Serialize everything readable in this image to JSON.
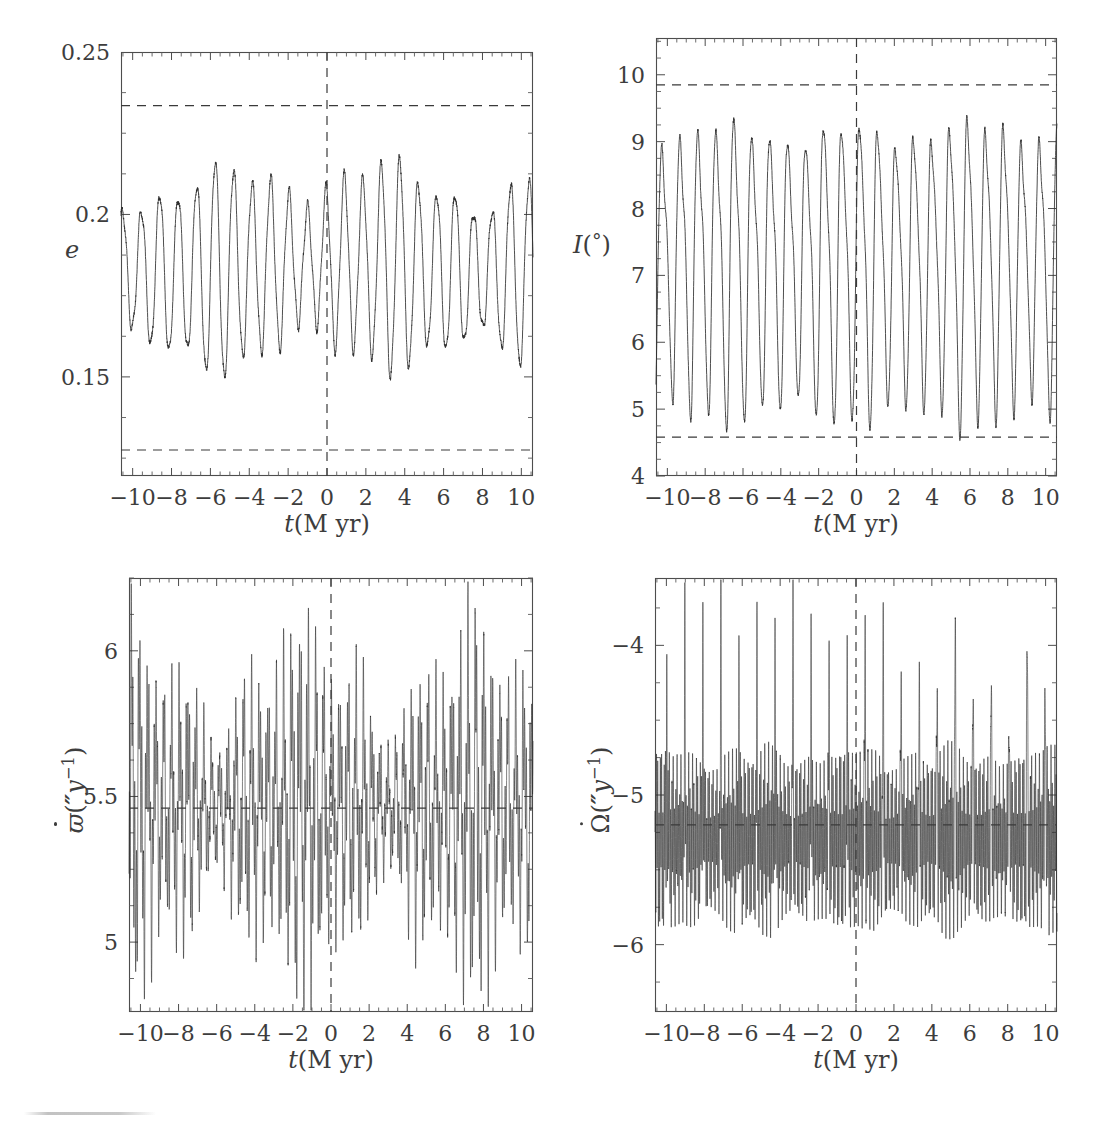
{
  "figure": {
    "background_color": "#ffffff",
    "line_color": "#2e2e2e",
    "axis_color": "#4d4d4d",
    "guide_color": "#3a3a3a",
    "width": 1106,
    "height": 1134
  },
  "panels": [
    {
      "id": "eccentricity",
      "y_label_text": "e",
      "y_label_style": "italic",
      "x_label_text": "t(M yr)"
    },
    {
      "id": "inclination",
      "y_label_text": "I(°)",
      "x_label_text": "t(M yr)"
    },
    {
      "id": "pericenter-rate",
      "y_label_text": "ϖ̇(\"y⁻¹)",
      "x_label_text": "t(M yr)"
    },
    {
      "id": "node-rate",
      "y_label_text": "Ω̇(\"y⁻¹)",
      "x_label_text": "t(M yr)"
    }
  ],
  "chart_data": [
    {
      "type": "line",
      "id": "eccentricity",
      "title": "",
      "xlabel": "t(M yr)",
      "ylabel": "e",
      "xlim": [
        -10.6,
        10.6
      ],
      "ylim": [
        0.1195,
        0.25
      ],
      "xticks": [
        -10,
        -8,
        -6,
        -4,
        -2,
        0,
        2,
        4,
        6,
        8,
        10
      ],
      "xticklabels": [
        "−10",
        "−8",
        "−6",
        "−4",
        "−2",
        "0",
        "2",
        "4",
        "6",
        "8",
        "10"
      ],
      "yticks": [
        0.15,
        0.2,
        0.25
      ],
      "yticklabels": [
        "0.15",
        "0.2",
        "0.25"
      ],
      "grid": false,
      "legend": "none",
      "annotations": [
        {
          "kind": "hline",
          "value": 0.2335,
          "style": "dashed",
          "label": "upper envelope"
        },
        {
          "kind": "hline",
          "value": 0.1275,
          "style": "dashed",
          "label": "lower envelope"
        },
        {
          "kind": "vline",
          "value": 0,
          "style": "dashed",
          "label": "present epoch"
        }
      ],
      "signal": {
        "mean": 0.1835,
        "carrier_period_Myr": 0.95,
        "modulation_periods_Myr": [
          8.6,
          3.05
        ],
        "amplitude_base": 0.0172,
        "amplitude_mod": 0.0345,
        "noise": 0.0012,
        "samples": 3400
      },
      "description": "Eccentricity oscillates about 0.1835 with a ~0.95 Myr carrier strongly amplitude-modulated on ~8.6 and ~3 Myr; extrema reach the dashed envelopes 0.2335 and 0.1275; a node of the modulation sits near t = -1 Myr and t = +7 Myr."
    },
    {
      "type": "line",
      "id": "inclination",
      "title": "",
      "xlabel": "t(M yr)",
      "ylabel": "I(°)",
      "xlim": [
        -10.6,
        10.6
      ],
      "ylim": [
        4.0,
        10.55
      ],
      "xticks": [
        -10,
        -8,
        -6,
        -4,
        -2,
        0,
        2,
        4,
        6,
        8,
        10
      ],
      "xticklabels": [
        "−10",
        "−8",
        "−6",
        "−4",
        "−2",
        "0",
        "2",
        "4",
        "6",
        "8",
        "10"
      ],
      "yticks": [
        4,
        5,
        6,
        7,
        8,
        9,
        10
      ],
      "yticklabels": [
        "4",
        "5",
        "6",
        "7",
        "8",
        "9",
        "10"
      ],
      "grid": false,
      "legend": "none",
      "annotations": [
        {
          "kind": "hline",
          "value": 9.85,
          "style": "dashed",
          "label": "upper envelope"
        },
        {
          "kind": "hline",
          "value": 4.58,
          "style": "dashed",
          "label": "lower envelope"
        },
        {
          "kind": "vline",
          "value": 0,
          "style": "dashed",
          "label": "present epoch"
        }
      ],
      "signal": {
        "mean": 7.2,
        "carrier_period_Myr": 0.95,
        "modulation_periods_Myr": [
          6.4,
          2.4
        ],
        "amplitude_base": 2.1,
        "amplitude_mod": 0.26,
        "noise": 0.05,
        "samples": 3400
      },
      "description": "Inclination sweeps between about 4.8° and 9.7° with a quasi-uniform ~0.95 Myr period; dashed envelopes mark 9.85° and 4.58°."
    },
    {
      "type": "line",
      "id": "pericenter-rate",
      "title": "",
      "xlabel": "t(M yr)",
      "ylabel": "ϖ̇(\"y⁻¹)",
      "xlim": [
        -10.6,
        10.6
      ],
      "ylim": [
        4.76,
        6.25
      ],
      "xticks": [
        -10,
        -8,
        -6,
        -4,
        -2,
        0,
        2,
        4,
        6,
        8,
        10
      ],
      "xticklabels": [
        "−10",
        "−8",
        "−6",
        "−4",
        "−2",
        "0",
        "2",
        "4",
        "6",
        "8",
        "10"
      ],
      "yticks": [
        5,
        5.5,
        6
      ],
      "yticklabels": [
        "5",
        "5.5",
        "6"
      ],
      "grid": false,
      "legend": "none",
      "annotations": [
        {
          "kind": "hline",
          "value": 5.46,
          "style": "dashed",
          "label": "mean rate"
        },
        {
          "kind": "vline",
          "value": 0,
          "style": "dashed",
          "label": "present epoch"
        }
      ],
      "signal": {
        "mean": 5.46,
        "carrier_period_Myr": 0.42,
        "fine_period_Myr": 0.093,
        "modulation_periods_Myr": [
          9.0,
          3.0
        ],
        "amplitude_base": 0.17,
        "amplitude_mod": 0.4,
        "noise": 0.02,
        "samples": 7200
      },
      "description": "Pericenter precession rate fluctuates about 5.46 arcsec per year, spanning roughly 4.8 to 6.15; the oscillation amplitude collapses near t = -6 and t = +3 Myr where the trace thickens into a dense band."
    },
    {
      "type": "line",
      "id": "node-rate",
      "title": "",
      "xlabel": "t(M yr)",
      "ylabel": "Ω̇(\"y⁻¹)",
      "xlim": [
        -10.6,
        10.6
      ],
      "ylim": [
        -6.45,
        -3.55
      ],
      "xticks": [
        -10,
        -8,
        -6,
        -4,
        -2,
        0,
        2,
        4,
        6,
        8,
        10
      ],
      "xticklabels": [
        "−10",
        "−8",
        "−6",
        "−4",
        "−2",
        "0",
        "2",
        "4",
        "6",
        "8",
        "10"
      ],
      "yticks": [
        -6,
        -5,
        -4
      ],
      "yticklabels": [
        "−6",
        "−5",
        "−4"
      ],
      "grid": false,
      "legend": "none",
      "annotations": [
        {
          "kind": "hline",
          "value": -5.2,
          "style": "dashed",
          "label": "mean rate"
        },
        {
          "kind": "vline",
          "value": 0,
          "style": "dashed",
          "label": "present epoch"
        }
      ],
      "signal": {
        "mean": -5.3,
        "carrier_period_Myr": 0.95,
        "fine_period_Myr": 0.068,
        "modulation_periods_Myr": [
          5.0,
          1.9
        ],
        "amplitude_base": 0.5,
        "amplitude_mod": 0.22,
        "spike_amplitude": 1.5,
        "noise": 0.03,
        "samples": 9000
      },
      "description": "Nodal regression rate hovers near −5.3 arcsec per year with sharp upward spikes to about −3.6 recurring every ~0.95 Myr on top of a dense band extending down to −6.1."
    }
  ]
}
